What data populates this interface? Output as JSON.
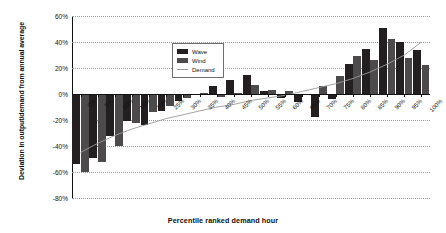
{
  "chart_data": {
    "type": "bar",
    "title": "",
    "xlabel": "Percentile ranked demand hour",
    "ylabel": "Deviation in output/demand from annual average",
    "ylim": [
      -80,
      60
    ],
    "ytick_labels": [
      "60%",
      "40%",
      "20%",
      "0%",
      "-20%",
      "-40%",
      "-60%",
      "-80%"
    ],
    "ytick_values": [
      60,
      40,
      20,
      0,
      -20,
      -40,
      -60,
      -80
    ],
    "grid": true,
    "legend_position": "upper-center",
    "categories": [
      "0%",
      "5%",
      "10%",
      "15%",
      "20%",
      "25%",
      "30%",
      "35%",
      "40%",
      "45%",
      "50%",
      "55%",
      "60%",
      "65%",
      "70%",
      "75%",
      "80%",
      "85%",
      "90%",
      "95%",
      "100%"
    ],
    "series": [
      {
        "name": "Wave",
        "color": "#231f20",
        "values": [
          -54,
          -49,
          -32,
          -21,
          -24,
          -13,
          -5,
          -1,
          6,
          11,
          15,
          2,
          -3,
          -6,
          -18,
          -4,
          23,
          35,
          51,
          40,
          34
        ]
      },
      {
        "name": "Wind",
        "color": "#4d4a4b",
        "values": [
          -60,
          -52,
          -40,
          -22,
          -14,
          -9,
          -3,
          1,
          -2,
          1,
          7,
          3,
          2,
          -1,
          6,
          14,
          29,
          26,
          42,
          28,
          22
        ]
      },
      {
        "name": "Demand",
        "color": "#9a9a9a",
        "type": "line",
        "values": [
          -45,
          -38,
          -32,
          -27,
          -23,
          -19,
          -16,
          -13,
          -10,
          -8,
          -5,
          -3,
          -1,
          2,
          5,
          8,
          12,
          17,
          23,
          30,
          40
        ]
      }
    ],
    "legend": [
      {
        "label": "Wave",
        "swatch": "solid",
        "color": "#231f20"
      },
      {
        "label": "Wind",
        "swatch": "solid",
        "color": "#4d4a4b"
      },
      {
        "label": "Demand",
        "swatch": "line",
        "color": "#9a9a9a"
      }
    ]
  }
}
